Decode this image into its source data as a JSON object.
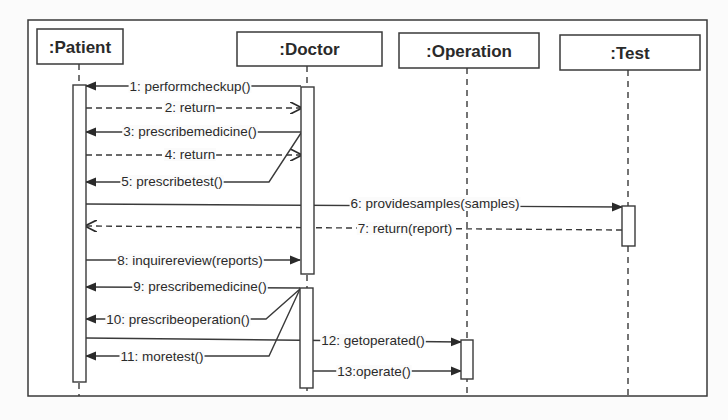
{
  "diagram": {
    "type": "UML sequence diagram",
    "colors": {
      "stroke": "#3a3a3a",
      "text": "#2a2a2a",
      "background": "#fbfbfb"
    },
    "frame": {
      "x": 28,
      "y": 20,
      "w": 679,
      "h": 376
    },
    "participants": [
      {
        "id": "patient",
        "label": ":Patient",
        "box": [
          37,
          29,
          86,
          35
        ],
        "lifeline_x": 79,
        "lifeline_end": 396
      },
      {
        "id": "doctor",
        "label": ":Doctor",
        "box": [
          237,
          32,
          145,
          34
        ],
        "lifeline_x": 307,
        "lifeline_end": 396
      },
      {
        "id": "operation",
        "label": ":Operation",
        "box": [
          399,
          33,
          140,
          35
        ],
        "lifeline_x": 467,
        "lifeline_end": 396
      },
      {
        "id": "test",
        "label": ":Test",
        "box": [
          560,
          35,
          140,
          35
        ],
        "lifeline_x": 628,
        "lifeline_end": 396
      }
    ],
    "activations": [
      {
        "participant": "patient",
        "x": 73,
        "y": 85,
        "w": 13,
        "h": 297
      },
      {
        "participant": "doctor",
        "x": 301,
        "y": 87,
        "w": 13,
        "h": 187
      },
      {
        "participant": "doctor",
        "x": 300,
        "y": 288,
        "w": 13,
        "h": 100
      },
      {
        "participant": "operation",
        "x": 461,
        "y": 340,
        "w": 12,
        "h": 39
      },
      {
        "participant": "test",
        "x": 622,
        "y": 206,
        "w": 13,
        "h": 40
      }
    ],
    "messages": [
      {
        "num": 1,
        "label": "1: performcheckup()",
        "from": "doctor",
        "to": "patient",
        "kind": "sync",
        "label_x": 190,
        "label_y": 91,
        "path": "M301,86 L86,86"
      },
      {
        "num": 2,
        "label": "2: return",
        "from": "patient",
        "to": "doctor",
        "kind": "return",
        "label_x": 190,
        "label_y": 112,
        "path": "M86,108 L301,108"
      },
      {
        "num": 3,
        "label": "3: prescribemedicine()",
        "from": "doctor",
        "to": "patient",
        "kind": "sync",
        "label_x": 190,
        "label_y": 136,
        "path": "M301,132 L86,132"
      },
      {
        "num": 4,
        "label": "4: return",
        "from": "patient",
        "to": "doctor",
        "kind": "return",
        "label_x": 190,
        "label_y": 159,
        "path": "M86,155 L301,155"
      },
      {
        "num": 5,
        "label": "5: prescribetest()",
        "from": "doctor",
        "to": "patient",
        "kind": "sync",
        "label_x": 172,
        "label_y": 186,
        "path": "M301,133 L269,182 L86,182"
      },
      {
        "num": 6,
        "label": "6: providesamples(samples)",
        "from": "patient",
        "to": "test",
        "kind": "sync",
        "label_x": 435,
        "label_y": 208,
        "path": "M86,204 L622,207"
      },
      {
        "num": 7,
        "label": "7: return(report)",
        "from": "test",
        "to": "patient",
        "kind": "return",
        "label_x": 405,
        "label_y": 233,
        "path": "M622,230 L86,226"
      },
      {
        "num": 8,
        "label": "8: inquirereview(reports)",
        "from": "patient",
        "to": "doctor",
        "kind": "sync",
        "label_x": 190,
        "label_y": 265,
        "path": "M86,260 L300,260"
      },
      {
        "num": 9,
        "label": "9: prescribemedicine()",
        "from": "doctor",
        "to": "patient",
        "kind": "sync",
        "label_x": 200,
        "label_y": 291,
        "path": "M300,288 L86,287"
      },
      {
        "num": 10,
        "label": "10: prescribeoperation()",
        "from": "doctor",
        "to": "patient",
        "kind": "sync",
        "label_x": 178,
        "label_y": 324,
        "path": "M300,289 L266,319 L86,319"
      },
      {
        "num": 11,
        "label": "11: moretest()",
        "from": "doctor",
        "to": "patient",
        "kind": "sync",
        "label_x": 162,
        "label_y": 361,
        "path": "M300,289 L269,356 L86,356"
      },
      {
        "num": 12,
        "label": "12: getoperated()",
        "from": "patient",
        "to": "operation",
        "kind": "sync",
        "label_x": 373,
        "label_y": 345,
        "path": "M86,338 L461,342"
      },
      {
        "num": 13,
        "label": "13:operate()",
        "from": "doctor",
        "to": "operation",
        "kind": "sync",
        "label_x": 374,
        "label_y": 376,
        "path": "M313,371 L461,371"
      }
    ]
  }
}
